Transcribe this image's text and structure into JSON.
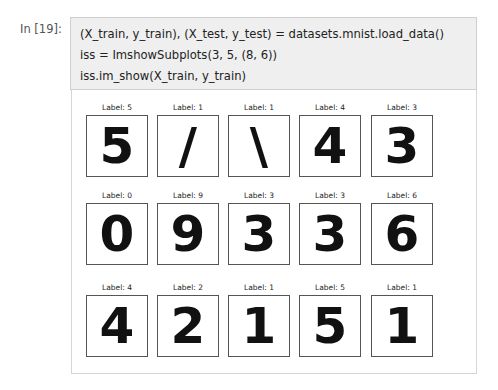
{
  "cell": {
    "prompt": "In [19]:",
    "code_lines": [
      "(X_train, y_train), (X_test, y_test) = datasets.mnist.load_data()",
      "iss = ImshowSubplots(3, 5, (8, 6))",
      "iss.im_show(X_train, y_train)"
    ]
  },
  "output": {
    "grid": {
      "rows": 3,
      "cols": 5
    },
    "subplots": [
      {
        "label": "Label: 5",
        "digit": "5"
      },
      {
        "label": "Label: 1",
        "digit": "/"
      },
      {
        "label": "Label: 1",
        "digit": "\\"
      },
      {
        "label": "Label: 4",
        "digit": "4"
      },
      {
        "label": "Label: 3",
        "digit": "3"
      },
      {
        "label": "Label: 0",
        "digit": "0"
      },
      {
        "label": "Label: 9",
        "digit": "9"
      },
      {
        "label": "Label: 3",
        "digit": "3"
      },
      {
        "label": "Label: 3",
        "digit": "3"
      },
      {
        "label": "Label: 6",
        "digit": "6"
      },
      {
        "label": "Label: 4",
        "digit": "4"
      },
      {
        "label": "Label: 2",
        "digit": "2"
      },
      {
        "label": "Label: 1",
        "digit": "1"
      },
      {
        "label": "Label: 5",
        "digit": "5"
      },
      {
        "label": "Label: 1",
        "digit": "1"
      }
    ]
  }
}
